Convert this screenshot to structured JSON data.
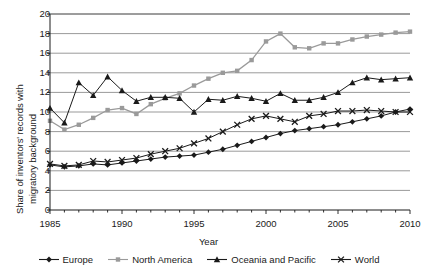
{
  "chart_data": {
    "type": "line",
    "title": "",
    "xlabel": "Year",
    "ylabel": "Share of inventors' records with migratory background",
    "ylabel_line1": "Share of inventors' records with",
    "ylabel_line2": "migratory background",
    "xlim": [
      1985,
      2010
    ],
    "ylim": [
      0,
      20
    ],
    "ytick_step": 2,
    "xtick_step": 5,
    "yticks": [
      0,
      2,
      4,
      6,
      8,
      10,
      12,
      14,
      16,
      18,
      20
    ],
    "xticks": [
      1985,
      1990,
      1995,
      2000,
      2005,
      2010
    ],
    "xtick_labels": [
      "1985",
      "1990",
      "1995",
      "2000",
      "2005",
      "2010"
    ],
    "ytick_labels": [
      "0",
      "2",
      "4",
      "6",
      "8",
      "10",
      "12",
      "14",
      "16",
      "18",
      "20"
    ],
    "grid": true,
    "grid_axis": "y",
    "legend_position": "bottom",
    "x": [
      1985,
      1986,
      1987,
      1988,
      1989,
      1990,
      1991,
      1992,
      1993,
      1994,
      1995,
      1996,
      1997,
      1998,
      1999,
      2000,
      2001,
      2002,
      2003,
      2004,
      2005,
      2006,
      2007,
      2008,
      2009,
      2010
    ],
    "series": [
      {
        "name": "Europe",
        "marker": "diamond",
        "color": "#1a1a1a",
        "values": [
          4.6,
          4.4,
          4.5,
          4.7,
          4.6,
          4.8,
          5.0,
          5.2,
          5.4,
          5.5,
          5.6,
          5.9,
          6.2,
          6.6,
          7.0,
          7.4,
          7.8,
          8.1,
          8.3,
          8.5,
          8.7,
          9.0,
          9.3,
          9.6,
          10.0,
          10.3
        ]
      },
      {
        "name": "North America",
        "marker": "square",
        "color": "#9a9a9a",
        "values": [
          9.1,
          8.2,
          8.7,
          9.4,
          10.2,
          10.4,
          9.8,
          10.8,
          11.4,
          11.9,
          12.7,
          13.4,
          14.0,
          14.2,
          15.3,
          17.2,
          18.0,
          16.6,
          16.5,
          17.0,
          17.0,
          17.4,
          17.7,
          17.9,
          18.1,
          18.2
        ]
      },
      {
        "name": "Oceania and Pacific",
        "marker": "triangle",
        "color": "#1a1a1a",
        "values": [
          10.4,
          8.9,
          13.0,
          11.7,
          13.6,
          12.2,
          11.1,
          11.5,
          11.5,
          11.4,
          10.0,
          11.3,
          11.2,
          11.6,
          11.4,
          11.1,
          11.9,
          11.2,
          11.2,
          11.5,
          12.0,
          13.0,
          13.5,
          13.3,
          13.4,
          13.5
        ]
      },
      {
        "name": "World",
        "marker": "x",
        "color": "#1a1a1a",
        "values": [
          4.7,
          4.5,
          4.6,
          5.0,
          4.9,
          5.1,
          5.3,
          5.7,
          6.0,
          6.3,
          6.8,
          7.3,
          8.0,
          8.7,
          9.3,
          9.6,
          9.3,
          9.0,
          9.6,
          9.8,
          10.1,
          10.1,
          10.2,
          10.1,
          10.0,
          10.0
        ]
      }
    ]
  }
}
